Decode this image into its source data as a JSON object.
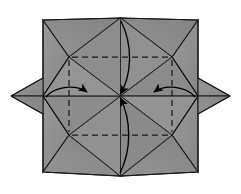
{
  "figure": {
    "title": "Origami fold step diagram",
    "type": "origami-diagram",
    "width": 241,
    "height": 194,
    "background_color": "#ffffff"
  },
  "colors": {
    "paper_fill": "#8f8f8f",
    "paper_fill_light": "#9a9a9a",
    "paper_fill_dark": "#828282",
    "edge_stroke": "#1a1a1a",
    "crease_dashed": "#1a1a1a",
    "arrow_stroke": "#000000",
    "background": "#ffffff"
  },
  "geometry": {
    "center": {
      "x": 120.5,
      "y": 96
    },
    "octagon_points": [
      {
        "name": "top",
        "x": 120.5,
        "y": 18
      },
      {
        "name": "upper-right",
        "x": 172,
        "y": 57
      },
      {
        "name": "right",
        "x": 198,
        "y": 96
      },
      {
        "name": "lower-right",
        "x": 172,
        "y": 135
      },
      {
        "name": "bottom",
        "x": 120.5,
        "y": 176
      },
      {
        "name": "lower-left",
        "x": 69,
        "y": 135
      },
      {
        "name": "left",
        "x": 43,
        "y": 96
      },
      {
        "name": "upper-left",
        "x": 69,
        "y": 57
      }
    ],
    "star_tips": [
      {
        "name": "tip-top-left",
        "x": 43,
        "y": 20
      },
      {
        "name": "tip-top-right",
        "x": 198,
        "y": 20
      },
      {
        "name": "tip-right",
        "x": 230,
        "y": 96
      },
      {
        "name": "tip-bottom-right",
        "x": 198,
        "y": 172
      },
      {
        "name": "tip-bottom-left",
        "x": 43,
        "y": 172
      },
      {
        "name": "tip-left",
        "x": 11,
        "y": 96
      }
    ]
  },
  "creases": {
    "dashed_label": "valley fold",
    "solid_label": "existing crease",
    "lines": [
      {
        "name": "dashed-top-horizontal",
        "x1": 72,
        "y1": 57,
        "x2": 169,
        "y2": 57
      },
      {
        "name": "dashed-bottom-horizontal",
        "x1": 72,
        "y1": 135,
        "x2": 169,
        "y2": 135
      },
      {
        "name": "dashed-left-vertical",
        "x1": 69,
        "y1": 60,
        "x2": 69,
        "y2": 132
      },
      {
        "name": "dashed-right-vertical",
        "x1": 172,
        "y1": 60,
        "x2": 172,
        "y2": 132
      }
    ]
  },
  "arrows": [
    {
      "name": "arrow-left-fold",
      "direction": "left-to-right",
      "from_x": 47,
      "from_y": 96,
      "to_x": 88,
      "to_y": 93
    },
    {
      "name": "arrow-right-fold",
      "direction": "right-to-left",
      "from_x": 194,
      "from_y": 96,
      "to_x": 153,
      "to_y": 93
    },
    {
      "name": "arrow-top-fold",
      "direction": "top-to-bottom",
      "from_x": 121,
      "from_y": 20,
      "to_x": 120,
      "to_y": 94
    },
    {
      "name": "arrow-bottom-fold",
      "direction": "bottom-to-top",
      "from_x": 120,
      "from_y": 172,
      "to_x": 121,
      "to_y": 98
    }
  ]
}
